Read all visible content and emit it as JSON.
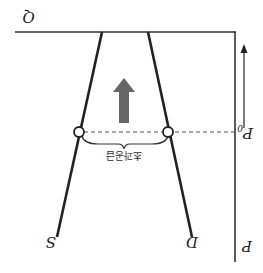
{
  "diagram": {
    "orientation": "rotated-180",
    "labels": {
      "quantity_axis": "Q",
      "price_axis": "P",
      "equilibrium_price": "P",
      "equilibrium_price_subscript": "0",
      "supply_curve": "S",
      "demand_curve": "D",
      "excess_label": "초과공급"
    },
    "icons": {
      "price_direction_arrow": "arrow-icon",
      "big_arrow": "thick-arrow-icon"
    },
    "colors": {
      "line": "#222222",
      "big_arrow": "#666666",
      "dashed": "#555555"
    }
  }
}
